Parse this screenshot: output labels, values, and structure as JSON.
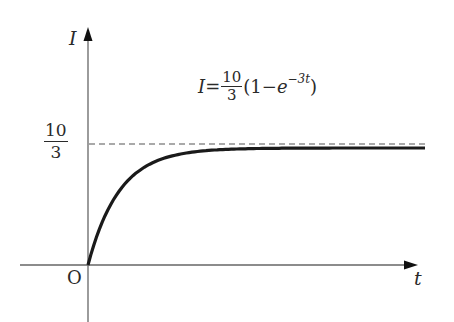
{
  "chart_data": {
    "type": "line",
    "title": "",
    "xlabel": "t",
    "ylabel": "I",
    "origin_label": "O",
    "formula": {
      "lhs": "I",
      "equals": "=",
      "coef_num": "10",
      "coef_den": "3",
      "paren_open": "(1",
      "minus": "−",
      "base": "e",
      "exponent": "−3t",
      "paren_close": ")"
    },
    "function": "I = (10/3)(1 - e^(-3t))",
    "asymptote": {
      "value": 3.3333,
      "label_num": "10",
      "label_den": "3",
      "style": "dashed"
    },
    "y_ticks": [
      {
        "value": 3.3333,
        "label": "10/3"
      }
    ],
    "x": [
      0,
      0.1,
      0.2,
      0.3,
      0.4,
      0.5,
      0.6,
      0.8,
      1.0,
      1.2,
      1.5,
      2.0,
      2.5,
      3.0,
      3.5
    ],
    "series": [
      {
        "name": "I(t)",
        "values": [
          0,
          0.864,
          1.504,
          1.98,
          2.329,
          2.59,
          2.783,
          2.997,
          3.167,
          3.243,
          3.297,
          3.325,
          3.332,
          3.333,
          3.333
        ]
      }
    ],
    "xlim": [
      0,
      3.6
    ],
    "ylim": [
      -0.5,
      6.5
    ],
    "grid": false,
    "legend": null,
    "colors": {
      "curve": "#1a1a1a",
      "axis": "#555555",
      "asymptote": "#555555"
    }
  }
}
